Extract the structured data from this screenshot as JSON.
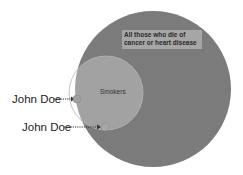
{
  "diagram": {
    "type": "venn",
    "outer_set": {
      "label": "All those who die of cancer or heart disease",
      "color": "#7a7a7a"
    },
    "inner_set": {
      "label": "Smokers",
      "overlap_color": "#a0a0a0",
      "outside_color": "#ffffff"
    },
    "points": [
      {
        "label": "John Doe",
        "style": "filled",
        "location": "smoker, not in outer set"
      },
      {
        "label": "John Doe",
        "style": "outline",
        "location": "smoker, in outer set"
      }
    ]
  }
}
